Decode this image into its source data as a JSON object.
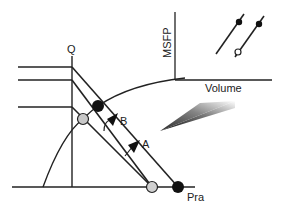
{
  "diagram": {
    "labels": {
      "q": "Q",
      "b": "B",
      "a": "A",
      "pra": "Pra"
    },
    "inset": {
      "ylabel": "MSFP",
      "xlabel": "Volume"
    },
    "colors": {
      "line": "#222222",
      "filled_point": "#111111",
      "grey_point": "#c8c8c8",
      "background": "#ffffff"
    }
  }
}
